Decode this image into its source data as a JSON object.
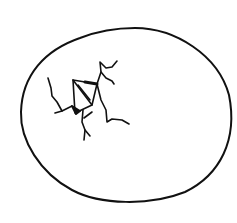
{
  "image": {
    "subject": "cracked egg line drawing",
    "stroke_color": "#111111",
    "background": "#ffffff"
  }
}
